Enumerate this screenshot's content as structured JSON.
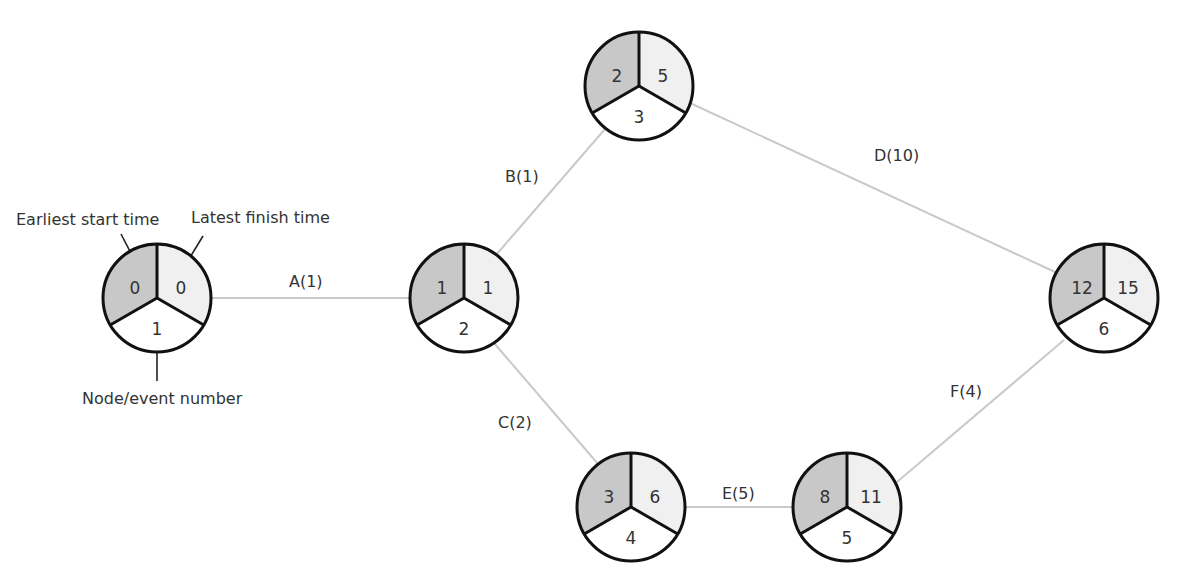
{
  "diagram": {
    "type": "activity-on-arrow network",
    "colors": {
      "earliest_sector": "#c8c8c8",
      "latest_sector": "#f0f0f0",
      "node_sector": "#ffffff",
      "outline": "#111111",
      "edge": "#c9c9c9",
      "text": "#333333"
    },
    "legend": {
      "earliest_label": "Earliest start time",
      "latest_label": "Latest finish time",
      "node_label": "Node/event number"
    },
    "nodes": [
      {
        "id": "1",
        "earliest": "0",
        "latest": "0",
        "number": "1",
        "cx": 157,
        "cy": 298
      },
      {
        "id": "2",
        "earliest": "1",
        "latest": "1",
        "number": "2",
        "cx": 464,
        "cy": 298
      },
      {
        "id": "3",
        "earliest": "2",
        "latest": "5",
        "number": "3",
        "cx": 639,
        "cy": 86
      },
      {
        "id": "4",
        "earliest": "3",
        "latest": "6",
        "number": "4",
        "cx": 631,
        "cy": 507
      },
      {
        "id": "5",
        "earliest": "8",
        "latest": "11",
        "number": "5",
        "cx": 847,
        "cy": 507
      },
      {
        "id": "6",
        "earliest": "12",
        "latest": "15",
        "number": "6",
        "cx": 1104,
        "cy": 298
      }
    ],
    "edges": [
      {
        "from": "1",
        "to": "2",
        "label": "A(1)"
      },
      {
        "from": "2",
        "to": "3",
        "label": "B(1)"
      },
      {
        "from": "2",
        "to": "4",
        "label": "C(2)"
      },
      {
        "from": "3",
        "to": "6",
        "label": "D(10)"
      },
      {
        "from": "4",
        "to": "5",
        "label": "E(5)"
      },
      {
        "from": "5",
        "to": "6",
        "label": "F(4)"
      }
    ]
  }
}
